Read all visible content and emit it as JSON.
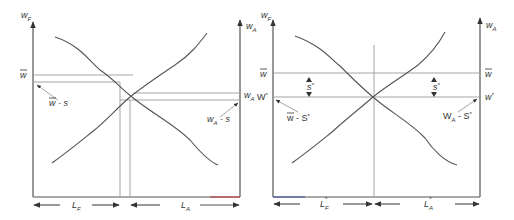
{
  "diagrams": [
    {
      "id": "left",
      "y_axis_left_label": "w",
      "y_axis_left_sub": "F",
      "y_axis_right_label": "w",
      "y_axis_right_sub": "A",
      "level_left_label": "w",
      "level_left_bar": true,
      "annot_left_main": "w",
      "annot_left_rest": " - s",
      "level_right_label": "w",
      "level_right_sub": "A",
      "annot_right_main": "w",
      "annot_right_sub": "A",
      "annot_right_rest": " - s",
      "x_left_label": "L",
      "x_left_sub": "F",
      "x_right_label": "L",
      "x_right_sub": "A"
    },
    {
      "id": "right",
      "y_axis_left_label": "w",
      "y_axis_left_sub": "F",
      "y_axis_right_label": "w",
      "y_axis_right_sub": "A",
      "level_top_left": "w",
      "level_top_right": "w",
      "level_star_left": "W",
      "level_star_left_sup": "*",
      "level_star_right": "w",
      "level_star_right_sup": "*",
      "gap_left_label": "s",
      "gap_left_sup": "*",
      "gap_right_label": "s",
      "gap_right_sup": "*",
      "annot_left_main": "w",
      "annot_left_rest": " - S",
      "annot_left_sup": "*",
      "annot_right_main": "W",
      "annot_right_sub": "A",
      "annot_right_rest": " - S",
      "annot_right_sup": "*",
      "x_left_label": "L",
      "x_left_sub": "F",
      "x_left_sup": "*",
      "x_right_label": "L",
      "x_right_sub": "A",
      "x_right_sup": "*"
    }
  ]
}
